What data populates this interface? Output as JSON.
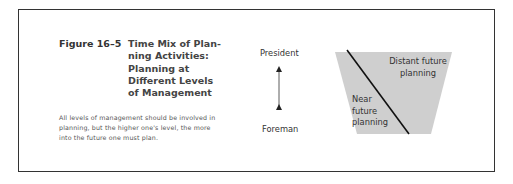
{
  "figure": {
    "label": "Figure 16–5",
    "title_lines": [
      "Time Mix of Plan-",
      "ning Activities:",
      "Planning at",
      "Different Levels",
      "of Management"
    ],
    "caption": "All levels of management should be in­volved in planning, but the higher one's level, the more into the future one must plan."
  },
  "diagram": {
    "top_level": "President",
    "bottom_level": "Foreman",
    "upper_region": [
      "Distant future",
      "planning"
    ],
    "lower_region": [
      "Near",
      "future",
      "planning"
    ],
    "fill_color": "#cfcfcf",
    "line_color": "#111111"
  }
}
